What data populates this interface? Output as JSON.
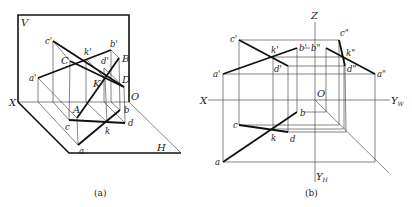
{
  "figure_a": {
    "caption": "(a)",
    "plane_labels": {
      "v": "V",
      "h": "H",
      "x": "X",
      "o": "O"
    },
    "points_space": {
      "A": "A",
      "B": "B",
      "C": "C",
      "D": "D",
      "K": "K"
    },
    "points_v": {
      "a": "a'",
      "b": "b'",
      "c": "c'",
      "d": "d'",
      "k": "k'"
    },
    "points_h": {
      "a": "a",
      "b": "b",
      "c": "c",
      "d": "d",
      "k": "k"
    }
  },
  "figure_b": {
    "caption": "(b)",
    "axis_labels": {
      "z": "Z",
      "x": "X",
      "yw": "Y",
      "yw_sub": "W",
      "yh": "Y",
      "yh_sub": "H",
      "o": "O"
    },
    "points_v": {
      "a": "a'",
      "b": "b'",
      "c": "c'",
      "d": "d'",
      "k": "k'"
    },
    "points_w": {
      "a": "a\"",
      "b": "b\"",
      "c": "c\"",
      "d": "d\"",
      "k": "k\""
    },
    "points_h": {
      "a": "a",
      "b": "b",
      "c": "c",
      "d": "d",
      "k": "k"
    }
  }
}
